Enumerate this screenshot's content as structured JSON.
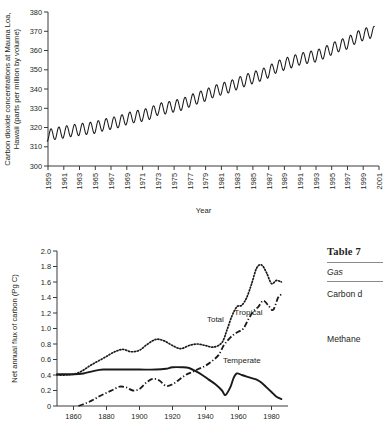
{
  "chart_data": [
    {
      "id": "mauna-loa-co2",
      "type": "line",
      "title": "",
      "xlabel": "Year",
      "ylabel": "Carbon dioxide concentrations at Mauna Loa, Hawaii (parts per million by volume)",
      "xlim": [
        1959,
        2001
      ],
      "ylim": [
        300,
        380
      ],
      "ytick_step": 10,
      "grid": false,
      "legend": "none",
      "yticks": [
        300,
        310,
        320,
        330,
        340,
        350,
        360,
        370,
        380
      ],
      "xticks": [
        1959,
        1961,
        1963,
        1965,
        1967,
        1969,
        1971,
        1973,
        1975,
        1977,
        1979,
        1981,
        1983,
        1985,
        1987,
        1989,
        1991,
        1993,
        1995,
        1997,
        1999,
        2001
      ],
      "xtick_labels": [
        "1959",
        "1961",
        "1963",
        "1965",
        "1967",
        "1969",
        "1971",
        "1973",
        "1975",
        "1977",
        "1979",
        "1981",
        "1983",
        "1985",
        "1987",
        "1989",
        "1991",
        "1993",
        "1995",
        "1997",
        "1999",
        "2001"
      ],
      "series": [
        {
          "name": "Monthly mean CO2",
          "style": "solid-thin",
          "annual_mean_x": [
            1959,
            1960,
            1961,
            1962,
            1963,
            1964,
            1965,
            1966,
            1967,
            1968,
            1969,
            1970,
            1971,
            1972,
            1973,
            1974,
            1975,
            1976,
            1977,
            1978,
            1979,
            1980,
            1981,
            1982,
            1983,
            1984,
            1985,
            1986,
            1987,
            1988,
            1989,
            1990,
            1991,
            1992,
            1993,
            1994,
            1995,
            1996,
            1997,
            1998,
            1999,
            2000
          ],
          "annual_mean_y": [
            315.9,
            316.9,
            317.6,
            318.4,
            318.9,
            319.5,
            320.0,
            321.3,
            322.1,
            323.0,
            324.6,
            325.6,
            326.3,
            327.4,
            329.6,
            330.1,
            331.1,
            332.0,
            333.8,
            335.4,
            336.8,
            338.7,
            340.0,
            341.1,
            342.8,
            344.4,
            345.9,
            347.2,
            348.9,
            351.5,
            352.9,
            354.2,
            355.6,
            356.4,
            357.1,
            358.8,
            360.8,
            362.6,
            363.8,
            366.6,
            368.3,
            369.5
          ]
        }
      ]
    },
    {
      "id": "net-carbon-flux-landuse",
      "type": "line",
      "title": "",
      "xlabel": "",
      "ylabel": "Net annual flux of carbon (Pg C)",
      "xlim": [
        1850,
        1990
      ],
      "ylim": [
        0,
        2.0
      ],
      "ytick_step": 0.2,
      "grid": false,
      "legend": "inline-labels",
      "yticks": [
        0,
        0.2,
        0.4,
        0.6,
        0.8,
        1.0,
        1.2,
        1.4,
        1.6,
        1.8,
        2.0
      ],
      "ytick_labels": [
        "0",
        "0.2",
        "0.4",
        "0.6",
        "0.8",
        "1.0",
        "1.2",
        "1.4",
        "1.6",
        "1.8",
        "2.0"
      ],
      "xticks": [
        1860,
        1880,
        1900,
        1920,
        1940,
        1960,
        1980
      ],
      "xtick_labels": [
        "1860",
        "1880",
        "1900",
        "1920",
        "1940",
        "1960",
        "1980"
      ],
      "series": [
        {
          "name": "Total",
          "label": "Total",
          "style": "dotted",
          "label_x": 1946,
          "label_y": 1.08,
          "x": [
            1850,
            1855,
            1860,
            1865,
            1870,
            1875,
            1880,
            1885,
            1890,
            1895,
            1900,
            1905,
            1910,
            1915,
            1920,
            1925,
            1930,
            1935,
            1940,
            1945,
            1950,
            1953,
            1956,
            1959,
            1962,
            1965,
            1968,
            1971,
            1974,
            1977,
            1980,
            1983,
            1986
          ],
          "y": [
            0.4,
            0.4,
            0.41,
            0.45,
            0.52,
            0.58,
            0.64,
            0.7,
            0.73,
            0.7,
            0.72,
            0.8,
            0.86,
            0.84,
            0.78,
            0.74,
            0.78,
            0.8,
            0.78,
            0.76,
            0.82,
            0.98,
            1.16,
            1.28,
            1.3,
            1.4,
            1.58,
            1.78,
            1.82,
            1.72,
            1.58,
            1.62,
            1.6
          ]
        },
        {
          "name": "Tropical",
          "label": "Tropical",
          "style": "dash-dot",
          "label_x": 1966,
          "label_y": 1.18,
          "x": [
            1863,
            1868,
            1872,
            1876,
            1880,
            1884,
            1888,
            1892,
            1896,
            1900,
            1904,
            1908,
            1912,
            1916,
            1920,
            1924,
            1928,
            1932,
            1936,
            1940,
            1944,
            1948,
            1951,
            1954,
            1957,
            1960,
            1963,
            1966,
            1969,
            1972,
            1975,
            1978,
            1981,
            1984,
            1986
          ],
          "y": [
            0.0,
            0.04,
            0.08,
            0.13,
            0.17,
            0.21,
            0.25,
            0.24,
            0.2,
            0.22,
            0.3,
            0.35,
            0.33,
            0.26,
            0.28,
            0.34,
            0.4,
            0.44,
            0.48,
            0.52,
            0.58,
            0.66,
            0.78,
            0.86,
            0.92,
            0.96,
            1.0,
            1.12,
            1.22,
            1.28,
            1.36,
            1.3,
            1.24,
            1.4,
            1.44
          ]
        },
        {
          "name": "Temperate",
          "label": "Temperate",
          "style": "solid-thick",
          "label_x": 1962,
          "label_y": 0.56,
          "x": [
            1850,
            1860,
            1866,
            1872,
            1878,
            1890,
            1900,
            1910,
            1916,
            1920,
            1926,
            1930,
            1934,
            1938,
            1942,
            1946,
            1950,
            1952,
            1955,
            1957,
            1959,
            1962,
            1965,
            1968,
            1971,
            1974,
            1977,
            1980,
            1983,
            1986
          ],
          "y": [
            0.41,
            0.41,
            0.42,
            0.45,
            0.47,
            0.47,
            0.47,
            0.47,
            0.48,
            0.5,
            0.5,
            0.49,
            0.45,
            0.4,
            0.34,
            0.28,
            0.2,
            0.14,
            0.24,
            0.36,
            0.42,
            0.4,
            0.38,
            0.36,
            0.34,
            0.3,
            0.24,
            0.18,
            0.12,
            0.09
          ]
        }
      ]
    }
  ],
  "table": {
    "caption": "Table 7",
    "columns": [
      "Gas"
    ],
    "rows": [
      [
        "Carbon d"
      ],
      [
        "Methane"
      ]
    ]
  },
  "colors": {
    "ink": "#231f20",
    "line": "#1a1a1a",
    "axis": "#3a3a3a",
    "rule": "#8a8a8a",
    "background": "#ffffff"
  }
}
